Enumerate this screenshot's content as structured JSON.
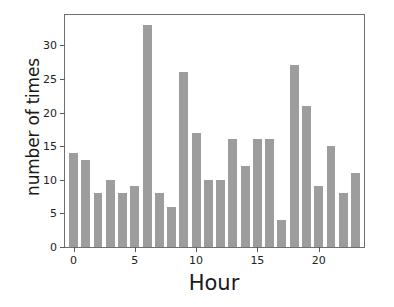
{
  "chart_data": {
    "type": "bar",
    "title": "",
    "xlabel": "Hour",
    "ylabel": "number of times",
    "categories": [
      0,
      1,
      2,
      3,
      4,
      5,
      6,
      7,
      8,
      9,
      10,
      11,
      12,
      13,
      14,
      15,
      16,
      17,
      18,
      19,
      20,
      21,
      22,
      23
    ],
    "values": [
      14,
      13,
      8,
      10,
      8,
      9,
      33,
      8,
      6,
      26,
      17,
      10,
      10,
      16,
      12,
      16,
      16,
      4,
      27,
      21,
      9,
      15,
      8,
      11
    ],
    "xticks": [
      0,
      5,
      10,
      15,
      20
    ],
    "xtick_labels": [
      "0",
      "5",
      "10",
      "15",
      "20"
    ],
    "yticks": [
      0,
      5,
      10,
      15,
      20,
      25,
      30
    ],
    "ytick_labels": [
      "0",
      "5",
      "10",
      "15",
      "20",
      "25",
      "30"
    ],
    "xlim": [
      -0.7,
      23.7
    ],
    "ylim": [
      0,
      34.5
    ],
    "grid": false,
    "legend": false,
    "bar_color": "#9d9d9d",
    "axis_color": "#6f6f6f",
    "text_color": "#1a1a1a",
    "background": "#ffffff"
  }
}
